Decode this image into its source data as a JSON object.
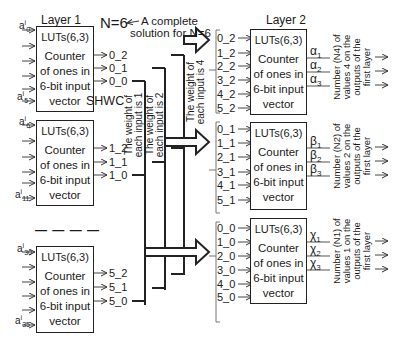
{
  "title_note": {
    "n_label": "N=6",
    "note": "A complete\nsolution for N=6",
    "note_line1": "A complete",
    "note_line2": "solution for N=6"
  },
  "layer1": {
    "label": "Layer 1",
    "shwc_label": "SHWC",
    "separator": "— — — —",
    "blocks": [
      {
        "lut": "LUTs(6,3)",
        "desc_lines": [
          "Counter",
          "of ones in",
          "6-bit input",
          "vector"
        ],
        "input_first": "a",
        "input_first_sup": "i",
        "input_first_sub": "0",
        "input_last": "a",
        "input_last_sup": "i",
        "input_last_sub": "5",
        "outputs": [
          "0_2",
          "0_1",
          "0_0"
        ]
      },
      {
        "lut": "LUTs(6,3)",
        "desc_lines": [
          "Counter",
          "of ones in",
          "6-bit input",
          "vector"
        ],
        "input_first": "a",
        "input_first_sup": "i",
        "input_first_sub": "6",
        "input_last": "a",
        "input_last_sup": "i",
        "input_last_sub": "11",
        "outputs": [
          "1_2",
          "1_1",
          "1_0"
        ]
      },
      {
        "lut": "LUTs(6,3)",
        "desc_lines": [
          "Counter",
          "of ones in",
          "6-bit input",
          "vector"
        ],
        "input_first": "a",
        "input_first_sup": "i",
        "input_first_sub": "30",
        "input_last": "a",
        "input_last_sup": "i",
        "input_last_sub": "35",
        "outputs": [
          "5_2",
          "5_1",
          "5_0"
        ]
      }
    ]
  },
  "buses": [
    {
      "label_line1": "The weight of",
      "label_line2": "each input is 1"
    },
    {
      "label_line1": "The weight of",
      "label_line2": "each input is 2"
    },
    {
      "label_line1": "The weight of",
      "label_line2": "each input is 4"
    }
  ],
  "layer2": {
    "label": "Layer 2",
    "blocks": [
      {
        "lut": "LUTs(6,3)",
        "desc_lines": [
          "Counter",
          "of ones in",
          "6-bit input",
          "vector"
        ],
        "inputs": [
          "0_2",
          "1_2",
          "2_2",
          "3_2",
          "4_2",
          "5_2"
        ],
        "outputs": [
          "α1",
          "α2",
          "α3"
        ],
        "output_base": "α",
        "output_subs": [
          "1",
          "2",
          "3"
        ],
        "note_lines": [
          "Number (N4) of",
          "values 4 on the",
          "outputs of the",
          "first layer"
        ]
      },
      {
        "lut": "LUTs(6,3)",
        "desc_lines": [
          "Counter",
          "of ones in",
          "6-bit input",
          "vector"
        ],
        "inputs": [
          "0_1",
          "1_1",
          "2_1",
          "3_1",
          "4_1",
          "5_1"
        ],
        "outputs": [
          "β1",
          "β2",
          "β3"
        ],
        "output_base": "β",
        "output_subs": [
          "1",
          "2",
          "3"
        ],
        "note_lines": [
          "Number (N2) of",
          "values 2 on the",
          "outputs of the",
          "first layer"
        ]
      },
      {
        "lut": "LUTs(6,3)",
        "desc_lines": [
          "Counter",
          "of ones in",
          "6-bit input",
          "vector"
        ],
        "inputs": [
          "0_0",
          "1_0",
          "2_0",
          "3_0",
          "4_0",
          "5_0"
        ],
        "outputs": [
          "χ1",
          "χ2",
          "χ3"
        ],
        "output_base": "χ",
        "output_subs": [
          "1",
          "2",
          "3"
        ],
        "note_lines": [
          "Number (N1) of",
          "values 1 on the",
          "outputs of the",
          "first layer"
        ]
      }
    ]
  }
}
